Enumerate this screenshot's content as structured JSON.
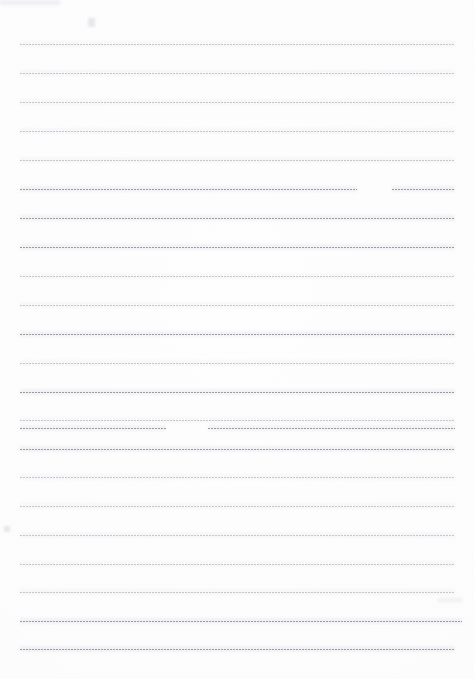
{
  "document": {
    "kind": "scanned-blank-lined-page",
    "title": "Blank lined notebook page",
    "page_width": 474,
    "page_height": 679,
    "background_color": "#fefefe",
    "rule_color": "#787a84",
    "rule_style": "dotted",
    "written_text": "",
    "margin_left": 20,
    "margin_right": 19,
    "first_rule_y": 44,
    "last_rule_y": 649,
    "rule_spacing": 28.8,
    "rule_count": 22
  },
  "rules": [
    {
      "index": 1,
      "y": 44,
      "x_start": 20,
      "x_end": 455,
      "opacity": "faded"
    },
    {
      "index": 2,
      "y": 73,
      "x_start": 20,
      "x_end": 455,
      "opacity": "faded"
    },
    {
      "index": 3,
      "y": 102,
      "x_start": 20,
      "x_end": 455,
      "opacity": "faded"
    },
    {
      "index": 4,
      "y": 131,
      "x_start": 20,
      "x_end": 455,
      "opacity": "faded"
    },
    {
      "index": 5,
      "y": 160,
      "x_start": 20,
      "x_end": 455,
      "opacity": "faded"
    },
    {
      "index": 6,
      "y": 189,
      "x_start": 20,
      "x_end": 455,
      "opacity": "strong",
      "gap_start": 357,
      "gap_end": 392
    },
    {
      "index": 7,
      "y": 218,
      "x_start": 20,
      "x_end": 455,
      "opacity": "strong"
    },
    {
      "index": 8,
      "y": 247,
      "x_start": 20,
      "x_end": 455,
      "opacity": "strong"
    },
    {
      "index": 9,
      "y": 276,
      "x_start": 20,
      "x_end": 455,
      "opacity": "faded"
    },
    {
      "index": 10,
      "y": 305,
      "x_start": 20,
      "x_end": 455,
      "opacity": "faded"
    },
    {
      "index": 11,
      "y": 334,
      "x_start": 20,
      "x_end": 455,
      "opacity": "strong"
    },
    {
      "index": 12,
      "y": 363,
      "x_start": 20,
      "x_end": 455,
      "opacity": "faded"
    },
    {
      "index": 13,
      "y": 392,
      "x_start": 20,
      "x_end": 455,
      "opacity": "strong"
    },
    {
      "index": 14,
      "y": 420,
      "x_start": 20,
      "x_end": 455,
      "opacity": "faded"
    },
    {
      "index": 15,
      "y": 449,
      "x_start": 20,
      "x_end": 455,
      "opacity": "strong"
    },
    {
      "index": 16,
      "y": 428,
      "x_start": 20,
      "x_end": 455,
      "opacity": "strong",
      "gap_start": 166,
      "gap_end": 208
    },
    {
      "index": 17,
      "y": 477,
      "x_start": 20,
      "x_end": 455,
      "opacity": "faded"
    },
    {
      "index": 18,
      "y": 506,
      "x_start": 20,
      "x_end": 455,
      "opacity": "faded"
    },
    {
      "index": 19,
      "y": 535,
      "x_start": 20,
      "x_end": 455,
      "opacity": "faded"
    },
    {
      "index": 20,
      "y": 564,
      "x_start": 20,
      "x_end": 455,
      "opacity": "faded"
    },
    {
      "index": 21,
      "y": 592,
      "x_start": 20,
      "x_end": 455,
      "opacity": "faded"
    },
    {
      "index": 22,
      "y": 621,
      "x_start": 20,
      "x_end": 462,
      "opacity": "strong"
    },
    {
      "index": 23,
      "y": 649,
      "x_start": 20,
      "x_end": 455,
      "opacity": "strong"
    }
  ],
  "artifacts": [
    {
      "name": "top-left-edge-shadow",
      "x": 0,
      "y": 0,
      "width": 60,
      "height": 5
    },
    {
      "name": "top-faint-speck",
      "x": 88,
      "y": 18,
      "width": 7,
      "height": 9
    },
    {
      "name": "left-margin-speck",
      "x": 4,
      "y": 526,
      "width": 6,
      "height": 6
    },
    {
      "name": "right-edge-darkening",
      "x": 438,
      "y": 598,
      "width": 24,
      "height": 4
    }
  ]
}
